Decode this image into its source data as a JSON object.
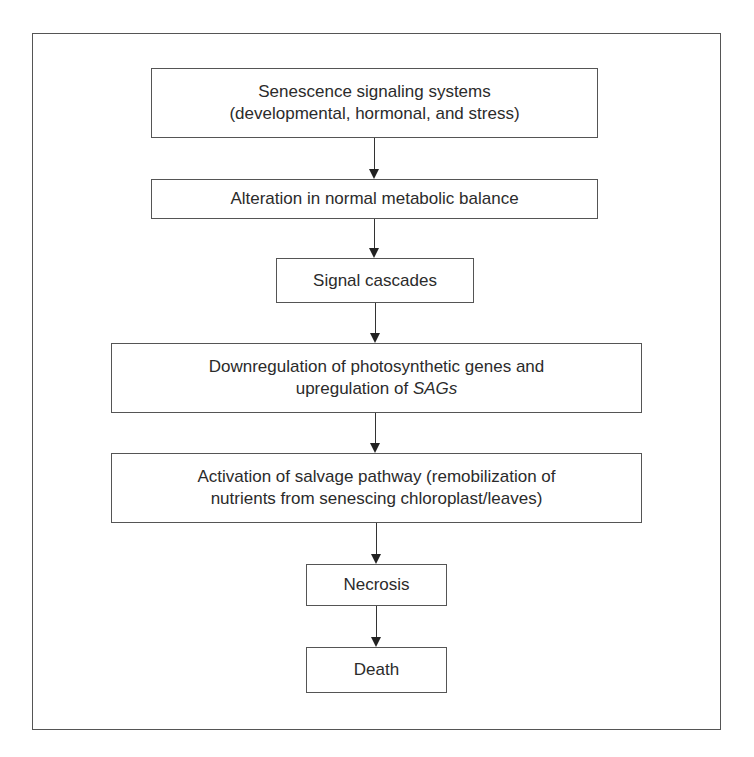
{
  "diagram": {
    "type": "flowchart",
    "direction": "top-to-bottom",
    "nodes": [
      {
        "id": "senescence-signaling",
        "lines": [
          "Senescence signaling systems",
          "(developmental, hormonal, and stress)"
        ]
      },
      {
        "id": "metabolic-alteration",
        "lines": [
          "Alteration in normal metabolic balance"
        ]
      },
      {
        "id": "signal-cascades",
        "lines": [
          "Signal cascades"
        ]
      },
      {
        "id": "gene-regulation",
        "lines": [
          "Downregulation of photosynthetic genes and",
          "upregulation of "
        ],
        "italic_suffix": "SAGs"
      },
      {
        "id": "salvage-pathway",
        "lines": [
          "Activation of salvage pathway (remobilization of",
          "nutrients from senescing chloroplast/leaves)"
        ]
      },
      {
        "id": "necrosis",
        "lines": [
          "Necrosis"
        ]
      },
      {
        "id": "death",
        "lines": [
          "Death"
        ]
      }
    ],
    "edges": [
      {
        "from": "senescence-signaling",
        "to": "metabolic-alteration"
      },
      {
        "from": "metabolic-alteration",
        "to": "signal-cascades"
      },
      {
        "from": "signal-cascades",
        "to": "gene-regulation"
      },
      {
        "from": "gene-regulation",
        "to": "salvage-pathway"
      },
      {
        "from": "salvage-pathway",
        "to": "necrosis"
      },
      {
        "from": "necrosis",
        "to": "death"
      }
    ]
  },
  "colors": {
    "border": "#555555",
    "text": "#2b2b2b",
    "arrow": "#222222",
    "background": "#ffffff"
  }
}
